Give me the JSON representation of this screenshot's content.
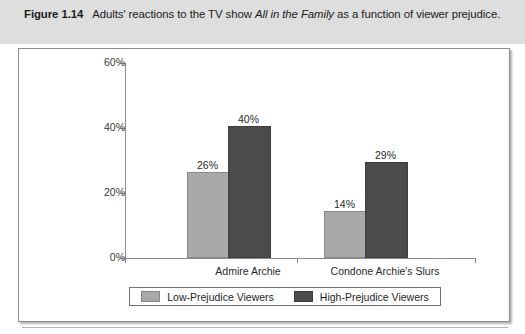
{
  "caption": {
    "figure_number": "Figure 1.14",
    "text_before_italic": "Adults' reactions to the TV show ",
    "italic_title": "All in the Family",
    "text_after_italic": " as a function of viewer prejudice."
  },
  "colors": {
    "low_prejudice_bar": "#a9a9a9",
    "high_prejudice_bar": "#4b4b4b",
    "caption_band": "#dedede",
    "axis": "#8a8a8a",
    "frame_border": "#8d8d8d"
  },
  "chart_data": {
    "type": "bar",
    "title": "",
    "xlabel": "",
    "ylabel": "",
    "ylim": [
      0,
      60
    ],
    "yticks": [
      0,
      20,
      40,
      60
    ],
    "ytick_labels": [
      "0%",
      "20%",
      "40%",
      "60%"
    ],
    "grid": false,
    "legend_position": "bottom",
    "categories": [
      "Admire Archie",
      "Condone Archie's Slurs"
    ],
    "series": [
      {
        "name": "Low-Prejudice Viewers",
        "values": [
          26,
          14
        ],
        "value_labels": [
          "26%",
          "14%"
        ],
        "color": "#a9a9a9"
      },
      {
        "name": "High-Prejudice Viewers",
        "values": [
          40,
          29
        ],
        "value_labels": [
          "40%",
          "29%"
        ],
        "color": "#4b4b4b"
      }
    ]
  },
  "legend": {
    "entries": [
      {
        "label": "Low-Prejudice Viewers"
      },
      {
        "label": "High-Prejudice Viewers"
      }
    ]
  }
}
